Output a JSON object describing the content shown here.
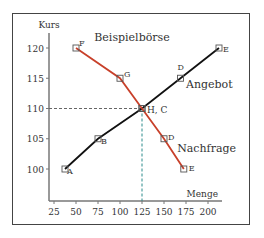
{
  "chart_data": {
    "type": "line",
    "title": "Beispielbörse",
    "xlabel": "Menge",
    "ylabel": "Kurs",
    "xlim": [
      20,
      220
    ],
    "ylim": [
      98,
      122
    ],
    "xticks": [
      25,
      50,
      75,
      100,
      125,
      150,
      175,
      200
    ],
    "yticks": [
      100,
      105,
      110,
      115,
      120
    ],
    "grid": false,
    "series": [
      {
        "name": "Angebot",
        "color": "#111111",
        "points": [
          {
            "label": "A",
            "x": 37.5,
            "y": 100
          },
          {
            "label": "B",
            "x": 75,
            "y": 105
          },
          {
            "label": "C",
            "x": 125,
            "y": 110
          },
          {
            "label": "D",
            "x": 168.75,
            "y": 115
          },
          {
            "label": "E",
            "x": 212.5,
            "y": 120
          }
        ]
      },
      {
        "name": "Nachfrage",
        "color": "#c8402a",
        "points": [
          {
            "label": "F",
            "x": 50,
            "y": 120
          },
          {
            "label": "G",
            "x": 100,
            "y": 115
          },
          {
            "label": "H",
            "x": 125,
            "y": 110
          },
          {
            "label": "D",
            "x": 150,
            "y": 105
          },
          {
            "label": "E",
            "x": 172.5,
            "y": 100
          }
        ]
      }
    ],
    "annotations": [
      {
        "text": "H, C",
        "x": 125,
        "y": 110,
        "type": "equilibrium"
      },
      {
        "type": "dashed-guide",
        "from": [
          20,
          110
        ],
        "to": [
          125,
          110
        ],
        "color": "#666666"
      },
      {
        "type": "dashed-guide",
        "from": [
          125,
          98
        ],
        "to": [
          125,
          110
        ],
        "color": "#2a8a8a"
      }
    ],
    "series_labels": [
      {
        "text": "Angebot",
        "x": 175,
        "y": 114
      },
      {
        "text": "Nachfrage",
        "x": 165,
        "y": 103.5
      }
    ]
  }
}
